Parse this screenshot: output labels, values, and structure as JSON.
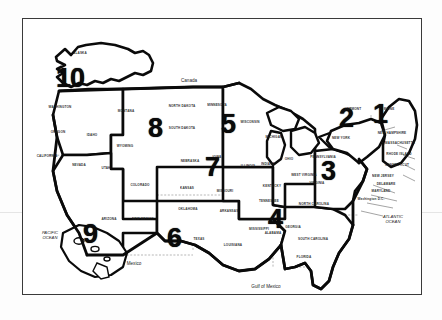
{
  "document": {
    "title": "United States Regional Map",
    "type": "scanned-map",
    "background_color": "#ffffff",
    "ink_color": "#0a0a0a",
    "frame_color": "#3a3a3a"
  },
  "regions": [
    {
      "number": "1",
      "name": "Region 1 - New England",
      "x": 379,
      "y": 113,
      "size": 27
    },
    {
      "number": "2",
      "name": "Region 2 - New York",
      "x": 345,
      "y": 117,
      "size": 27
    },
    {
      "number": "3",
      "name": "Region 3 - Mid Atlantic",
      "x": 327,
      "y": 170,
      "size": 27
    },
    {
      "number": "4",
      "name": "Region 4 - Southeast",
      "x": 274,
      "y": 218,
      "size": 27
    },
    {
      "number": "5",
      "name": "Region 5 - Great Lakes",
      "x": 227,
      "y": 123,
      "size": 27
    },
    {
      "number": "6",
      "name": "Region 6 - South Central",
      "x": 173,
      "y": 237,
      "size": 27
    },
    {
      "number": "7",
      "name": "Region 7 - Central",
      "x": 211,
      "y": 166,
      "size": 27
    },
    {
      "number": "8",
      "name": "Region 8 - Mountain",
      "x": 154,
      "y": 127,
      "size": 27
    },
    {
      "number": "9",
      "name": "Region 9 - Pacific",
      "x": 89,
      "y": 233,
      "size": 27
    },
    {
      "number": "10",
      "name": "Region 10 - Northwest",
      "x": 69,
      "y": 77,
      "size": 27
    }
  ],
  "states": [
    {
      "label": "ALASKA",
      "x": 79,
      "y": 52
    },
    {
      "label": "WASHINGTON",
      "x": 59,
      "y": 106
    },
    {
      "label": "OREGON",
      "x": 57,
      "y": 131
    },
    {
      "label": "IDAHO",
      "x": 91,
      "y": 134
    },
    {
      "label": "MONTANA",
      "x": 125,
      "y": 110
    },
    {
      "label": "NORTH DAKOTA",
      "x": 181,
      "y": 105
    },
    {
      "label": "SOUTH DAKOTA",
      "x": 181,
      "y": 127
    },
    {
      "label": "MINNESOTA",
      "x": 216,
      "y": 104
    },
    {
      "label": "WISCONSIN",
      "x": 249,
      "y": 121
    },
    {
      "label": "WYOMING",
      "x": 124,
      "y": 145
    },
    {
      "label": "UTAH",
      "x": 105,
      "y": 167
    },
    {
      "label": "NEVADA",
      "x": 78,
      "y": 164
    },
    {
      "label": "CALIFORNIA",
      "x": 46,
      "y": 155
    },
    {
      "label": "COLORADO",
      "x": 139,
      "y": 184
    },
    {
      "label": "NEBRASKA",
      "x": 189,
      "y": 160
    },
    {
      "label": "IOWA",
      "x": 216,
      "y": 156
    },
    {
      "label": "ILLINOIS",
      "x": 247,
      "y": 165
    },
    {
      "label": "INDIANA",
      "x": 267,
      "y": 163
    },
    {
      "label": "OHIO",
      "x": 288,
      "y": 158
    },
    {
      "label": "MICHIGAN",
      "x": 273,
      "y": 136
    },
    {
      "label": "KANSAS",
      "x": 186,
      "y": 187
    },
    {
      "label": "MISSOURI",
      "x": 224,
      "y": 190
    },
    {
      "label": "KENTUCKY",
      "x": 271,
      "y": 185
    },
    {
      "label": "ARIZONA",
      "x": 108,
      "y": 218
    },
    {
      "label": "NEW MEXICO",
      "x": 142,
      "y": 218
    },
    {
      "label": "OKLAHOMA",
      "x": 187,
      "y": 208
    },
    {
      "label": "ARKANSAS",
      "x": 228,
      "y": 210
    },
    {
      "label": "TEXAS",
      "x": 198,
      "y": 238
    },
    {
      "label": "LOUISIANA",
      "x": 232,
      "y": 244
    },
    {
      "label": "TENNESSEE",
      "x": 268,
      "y": 200
    },
    {
      "label": "MISSISSIPPI",
      "x": 258,
      "y": 228
    },
    {
      "label": "ALABAMA",
      "x": 272,
      "y": 232
    },
    {
      "label": "GEORGIA",
      "x": 292,
      "y": 226
    },
    {
      "label": "FLORIDA",
      "x": 303,
      "y": 256
    },
    {
      "label": "SOUTH CAROLINA",
      "x": 312,
      "y": 238
    },
    {
      "label": "NORTH CAROLINA",
      "x": 313,
      "y": 203
    },
    {
      "label": "VIRGINIA",
      "x": 316,
      "y": 182
    },
    {
      "label": "WEST VIRGINIA",
      "x": 303,
      "y": 174
    },
    {
      "label": "PENNSYLVANIA",
      "x": 322,
      "y": 156
    },
    {
      "label": "NEW YORK",
      "x": 340,
      "y": 137
    },
    {
      "label": "VERMONT",
      "x": 352,
      "y": 108
    },
    {
      "label": "MAINE",
      "x": 388,
      "y": 108
    },
    {
      "label": "NEW HAMPSHIRE",
      "x": 391,
      "y": 132
    },
    {
      "label": "MASSACHUSETTS",
      "x": 399,
      "y": 142
    },
    {
      "label": "RHODE ISLAND",
      "x": 398,
      "y": 153
    },
    {
      "label": "CONNECTICUT",
      "x": 396,
      "y": 164
    },
    {
      "label": "NEW JERSEY",
      "x": 382,
      "y": 175
    },
    {
      "label": "DELAWARE",
      "x": 385,
      "y": 183
    },
    {
      "label": "MARYLAND",
      "x": 380,
      "y": 190
    },
    {
      "label": "Washington D.C.",
      "x": 370,
      "y": 198
    }
  ],
  "geography": [
    {
      "label": "Canada",
      "x": 188,
      "y": 79,
      "style": "plain"
    },
    {
      "label": "Mexico",
      "x": 133,
      "y": 262,
      "style": "plain"
    },
    {
      "label": "Gulf of Mexico",
      "x": 265,
      "y": 285,
      "style": "plain"
    },
    {
      "label": "PACIFIC\nOCEAN",
      "x": 49,
      "y": 234,
      "style": "italic"
    },
    {
      "label": "ATLANTIC\nOCEAN",
      "x": 392,
      "y": 218,
      "style": "italic"
    }
  ],
  "legend": {
    "region_count": 10,
    "caption": ""
  }
}
